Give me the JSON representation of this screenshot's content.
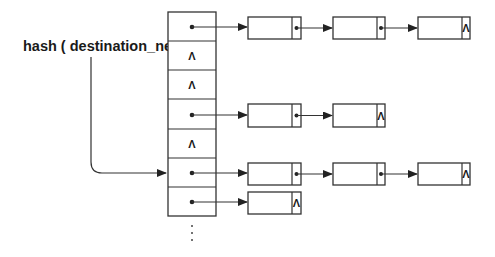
{
  "diagram": {
    "type": "hash-table-with-chaining",
    "hash_label": "hash ( destination_net )",
    "null_symbol": "Λ",
    "continuation": "⋮",
    "colors": {
      "stroke": "#333333",
      "text": "#1a1a1a",
      "background": "#ffffff"
    },
    "table": {
      "buckets": [
        {
          "index": 0,
          "pointer": true,
          "chain_length": 3
        },
        {
          "index": 1,
          "pointer": false,
          "chain_length": 0
        },
        {
          "index": 2,
          "pointer": false,
          "chain_length": 0
        },
        {
          "index": 3,
          "pointer": true,
          "chain_length": 2
        },
        {
          "index": 4,
          "pointer": false,
          "chain_length": 0
        },
        {
          "index": 5,
          "pointer": true,
          "chain_length": 3,
          "hash_target": true
        },
        {
          "index": 6,
          "pointer": true,
          "chain_length": 1
        }
      ]
    }
  }
}
